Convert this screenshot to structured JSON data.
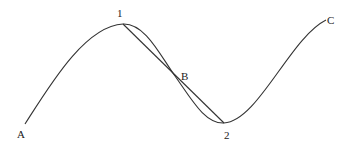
{
  "diagram": {
    "type": "curve-with-chords",
    "curve_color": "#333333",
    "chord_color": "#333333",
    "labels": {
      "A": "A",
      "one": "1",
      "B": "B",
      "two": "2",
      "C": "C"
    },
    "points": {
      "A": [
        25,
        124
      ],
      "one": [
        123,
        24
      ],
      "B": [
        175,
        76
      ],
      "two": [
        224,
        123
      ],
      "C": [
        326,
        20
      ]
    }
  }
}
